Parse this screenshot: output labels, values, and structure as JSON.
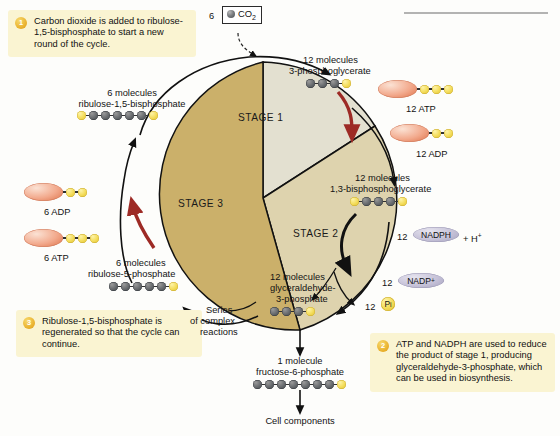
{
  "figure": {
    "cycle_label_1": "STAGE 1",
    "cycle_label_2": "STAGE 2",
    "cycle_label_3": "STAGE 3"
  },
  "colors": {
    "callout_bg": "#faf4d2",
    "badge": "#e8ae29",
    "stage1": "#e3e0d0",
    "stage2": "#ded3ae",
    "stage3": "#cbb06a",
    "atp_ellipse": "#f2a98c",
    "nadp_ellipse": "#c6c2d8",
    "phosphate_bead": "#f4dd5c",
    "carbon_bead": "#6e7174",
    "red_arrow": "#a02a28",
    "black_arrow": "#111111"
  },
  "callouts": [
    {
      "number": "1",
      "text": "Carbon dioxide is added to ribulose-1,5-bisphosphate to start a new round of the cycle."
    },
    {
      "number": "2",
      "text": "ATP and NADPH are used to reduce the product of stage 1, producing glyceraldehyde-3-phosphate, which can be used in biosynthesis."
    },
    {
      "number": "3",
      "text": "Ribulose-1,5-bisphosphate is regenerated so that the cycle can continue."
    }
  ],
  "inputs": {
    "co2_count": "6",
    "co2_label": "CO",
    "co2_sub": "2"
  },
  "molecules": {
    "ribulose_bisphosphate": {
      "count": "6 molecules",
      "name": "ribulose-1,5-bisphosphate",
      "beads": [
        "y",
        "g",
        "g",
        "g",
        "g",
        "g",
        "y"
      ]
    },
    "phosphoglycerate": {
      "count": "12 molecules",
      "name": "3-phosphoglycerate",
      "beads": [
        "g",
        "g",
        "g",
        "y"
      ]
    },
    "bisphosphoglycerate": {
      "count": "12 molecules",
      "name": "1,3-bisphosphoglycerate",
      "beads": [
        "y",
        "g",
        "g",
        "g",
        "y"
      ]
    },
    "glyceraldehyde_phosphate": {
      "count": "12 molecules",
      "name_line1": "glyceraldehyde-",
      "name_line2": "3-phosphate",
      "beads": [
        "g",
        "g",
        "g",
        "y"
      ]
    },
    "ribulose_phosphate": {
      "count": "6 molecules",
      "name": "ribulose-5-phosphate",
      "beads": [
        "g",
        "g",
        "g",
        "g",
        "g",
        "y"
      ]
    },
    "fructose_phosphate": {
      "count": "1 molecule",
      "name": "fructose-6-phosphate",
      "beads": [
        "g",
        "g",
        "g",
        "g",
        "g",
        "g",
        "g",
        "y"
      ]
    }
  },
  "energy_carriers": {
    "atp_top": {
      "label": "12 ATP",
      "beads": [
        "y",
        "y",
        "y"
      ]
    },
    "adp_top": {
      "label": "12 ADP",
      "beads": [
        "y",
        "y"
      ]
    },
    "adp_left": {
      "label": "6 ADP",
      "beads": [
        "y",
        "y"
      ]
    },
    "atp_left": {
      "label": "6 ATP",
      "beads": [
        "y",
        "y",
        "y"
      ]
    },
    "nadph": {
      "count": "12",
      "name": "NADPH",
      "suffix": "+ H",
      "suffix_sup": "+"
    },
    "nadp": {
      "count": "12",
      "name": "NADP",
      "name_sup": "+"
    },
    "phosphate": {
      "count": "12",
      "symbol": "P",
      "symbol_sub": "i"
    }
  },
  "annotations": {
    "series_line1": "Series",
    "series_line2": "of complex",
    "series_line3": "reactions",
    "cell_components": "Cell components"
  }
}
